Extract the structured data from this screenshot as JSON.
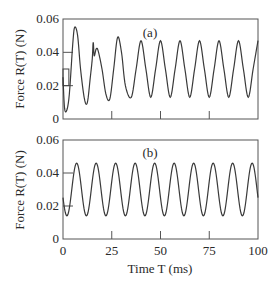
{
  "chart_data": [
    {
      "type": "line",
      "panel_label": "(a)",
      "title": "",
      "xlabel": "",
      "ylabel": "Force R(T)  (N)",
      "xlim": [
        0,
        100
      ],
      "ylim": [
        0,
        0.06
      ],
      "yticks": [
        "0",
        "0.02",
        "0.04",
        "0.06"
      ],
      "xticks": [
        25,
        50,
        75
      ],
      "xtick_labels_shown": false,
      "grid": false,
      "description": "Initial transient with irregular oscillation, then steady sinusoid of ~10 ms period oscillating between ~0.013 and ~0.047 N",
      "step_box": {
        "x": [
          0,
          3
        ],
        "y": [
          0.02,
          0.03
        ]
      },
      "x": [
        0,
        1,
        3,
        5,
        6,
        7.5,
        9,
        11,
        12.5,
        14,
        15,
        15.5,
        16,
        17,
        18,
        20,
        22,
        24,
        26,
        28,
        30,
        32,
        35,
        37.5,
        40,
        42.5,
        45,
        47.5,
        50,
        52.5,
        55,
        57.5,
        60,
        62.5,
        65,
        67.5,
        70,
        72.5,
        75,
        77.5,
        80,
        82.5,
        85,
        87.5,
        90,
        92.5,
        95,
        97.5,
        100
      ],
      "y": [
        0.025,
        0.005,
        0.012,
        0.045,
        0.055,
        0.05,
        0.03,
        0.012,
        0.01,
        0.025,
        0.036,
        0.046,
        0.038,
        0.042,
        0.041,
        0.03,
        0.015,
        0.012,
        0.03,
        0.049,
        0.04,
        0.02,
        0.013,
        0.03,
        0.047,
        0.03,
        0.013,
        0.03,
        0.047,
        0.03,
        0.013,
        0.03,
        0.047,
        0.03,
        0.013,
        0.03,
        0.047,
        0.03,
        0.013,
        0.03,
        0.047,
        0.03,
        0.013,
        0.03,
        0.047,
        0.03,
        0.013,
        0.03,
        0.047
      ]
    },
    {
      "type": "line",
      "panel_label": "(b)",
      "title": "",
      "xlabel": "Time T  (ms)",
      "ylabel": "Force R(T)  (N)",
      "xlim": [
        0,
        100
      ],
      "ylim": [
        0,
        0.06
      ],
      "yticks": [
        "0",
        "0.02",
        "0.04",
        "0.06"
      ],
      "xticks": [
        0,
        25,
        50,
        75,
        100
      ],
      "xtick_labels": [
        "0",
        "25",
        "50",
        "75",
        "100"
      ],
      "grid": false,
      "description": "Steady sinusoid from start, period ~10 ms, oscillating between ~0.014 and ~0.046 N; starts near 0.022 N at T=0",
      "sine": {
        "mean": 0.03,
        "amplitude": 0.016,
        "period_ms": 10,
        "first_peak_ms": 7
      }
    }
  ]
}
